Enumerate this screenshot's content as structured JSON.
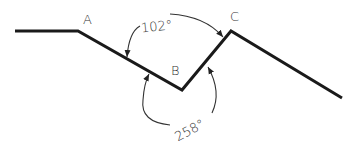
{
  "diagram": {
    "points": [
      {
        "name": "A",
        "label": "A"
      },
      {
        "name": "B",
        "label": "B"
      },
      {
        "name": "C",
        "label": "C"
      }
    ],
    "angles": [
      {
        "name": "interior",
        "value": "102°"
      },
      {
        "name": "exterior",
        "value": "258°"
      }
    ],
    "colors": {
      "line": "#1a1a1a",
      "arc": "#333333",
      "background": "#ffffff"
    }
  }
}
